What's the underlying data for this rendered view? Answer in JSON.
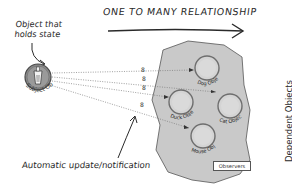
{
  "diagram": {
    "title": "ONE TO MANY RELATIONSHIP",
    "annotations": {
      "subject_note_line1": "Object that",
      "subject_note_line2": "holds state",
      "notification_note": "Automatic update/notification",
      "dependents_label": "Dependent Objects"
    },
    "subject": {
      "label": "Subject Object",
      "icon": "glass-icon"
    },
    "observers_group_label": "Observers",
    "observers": [
      {
        "label": "Dog Object"
      },
      {
        "label": "Duck Object"
      },
      {
        "label": "Cat Object"
      },
      {
        "label": "Mouse Object"
      }
    ],
    "connector_labels": [
      "8",
      "8",
      "8",
      "8"
    ],
    "colors": {
      "blob_fill": "#c9c9c9",
      "blob_stroke": "#555555",
      "circle_fill": "#d4d4d4",
      "circle_stroke": "#6e6e6e",
      "subject_fill": "#8a8a8a",
      "ink": "#2a2a2a"
    }
  }
}
